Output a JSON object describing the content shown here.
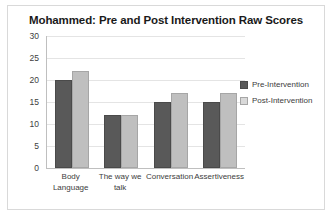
{
  "chart_data": {
    "type": "bar",
    "title": "Mohammed: Pre and Post Intervention Raw Scores",
    "xlabel": "",
    "ylabel": "",
    "ylim": [
      0,
      30
    ],
    "ytick_step": 5,
    "yticks": [
      30,
      25,
      20,
      15,
      10,
      5,
      0
    ],
    "grid": true,
    "legend_position": "right",
    "categories": [
      "Body Language",
      "The way we talk",
      "Conversation",
      "Assertiveness"
    ],
    "series": [
      {
        "name": "Pre-Intervention",
        "color": "#595959",
        "values": [
          20,
          12,
          15,
          15
        ]
      },
      {
        "name": "Post-Intervention",
        "color": "#bfbfbf",
        "values": [
          22,
          12,
          17,
          17
        ]
      }
    ]
  }
}
